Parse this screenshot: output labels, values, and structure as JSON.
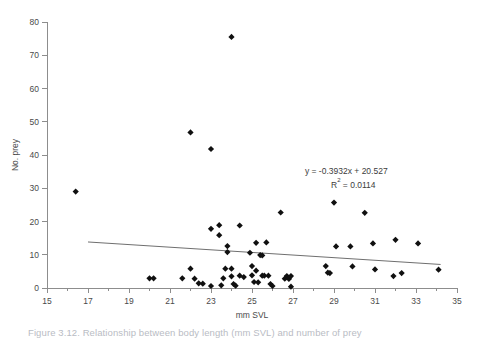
{
  "figure": {
    "caption": "Figure 3.12. Relationship between body length (mm SVL) and number of prey"
  },
  "annotation": {
    "equation": "y = -0.3932x + 20.527",
    "r_squared_prefix": "R",
    "r_squared_exponent": "2",
    "r_squared_value": " = 0.0114"
  },
  "colors": {
    "marker": "#101010",
    "trendline": "#6f6f6f",
    "axis": "#8d8d8d",
    "text": "#4a4a4a",
    "background": "#ffffff"
  },
  "chart_data": {
    "type": "scatter",
    "title": "",
    "xlabel": "mm SVL",
    "ylabel": "No. prey",
    "xlim": [
      15,
      35
    ],
    "ylim": [
      0,
      80
    ],
    "xticks": [
      15,
      17,
      19,
      21,
      23,
      25,
      27,
      29,
      31,
      33,
      35
    ],
    "xticks_minor": [
      16,
      18,
      20,
      22,
      24,
      26,
      28,
      30,
      32,
      34
    ],
    "yticks": [
      0,
      10,
      20,
      30,
      40,
      50,
      60,
      70,
      80
    ],
    "grid": false,
    "legend": false,
    "marker_shape": "diamond",
    "series": [
      {
        "name": "No. prey",
        "points": [
          [
            16.4,
            29.0
          ],
          [
            20.0,
            2.9
          ],
          [
            20.2,
            2.9
          ],
          [
            21.6,
            2.9
          ],
          [
            22.0,
            46.8
          ],
          [
            22.0,
            5.8
          ],
          [
            22.2,
            2.8
          ],
          [
            22.4,
            1.4
          ],
          [
            22.6,
            1.3
          ],
          [
            23.0,
            41.8
          ],
          [
            23.0,
            17.8
          ],
          [
            23.0,
            0.6
          ],
          [
            23.4,
            18.9
          ],
          [
            23.4,
            15.9
          ],
          [
            23.5,
            0.8
          ],
          [
            23.6,
            2.9
          ],
          [
            23.7,
            5.8
          ],
          [
            23.8,
            12.6
          ],
          [
            23.8,
            10.8
          ],
          [
            24.0,
            75.5
          ],
          [
            24.0,
            5.8
          ],
          [
            24.0,
            3.5
          ],
          [
            24.1,
            1.2
          ],
          [
            24.2,
            0.7
          ],
          [
            24.4,
            18.8
          ],
          [
            24.4,
            3.7
          ],
          [
            24.6,
            3.3
          ],
          [
            24.9,
            10.6
          ],
          [
            25.0,
            6.6
          ],
          [
            25.0,
            3.8
          ],
          [
            25.1,
            1.8
          ],
          [
            25.2,
            13.6
          ],
          [
            25.2,
            5.2
          ],
          [
            25.3,
            1.7
          ],
          [
            25.4,
            9.9
          ],
          [
            25.5,
            9.8
          ],
          [
            25.5,
            3.7
          ],
          [
            25.6,
            3.7
          ],
          [
            25.7,
            13.7
          ],
          [
            25.8,
            3.7
          ],
          [
            25.9,
            1.2
          ],
          [
            26.0,
            0.6
          ],
          [
            26.4,
            22.7
          ],
          [
            26.6,
            2.8
          ],
          [
            26.7,
            3.6
          ],
          [
            26.8,
            2.7
          ],
          [
            26.9,
            3.6
          ],
          [
            26.9,
            0.4
          ],
          [
            28.6,
            6.6
          ],
          [
            28.7,
            4.6
          ],
          [
            28.8,
            4.5
          ],
          [
            29.0,
            25.7
          ],
          [
            29.1,
            12.5
          ],
          [
            29.8,
            12.5
          ],
          [
            29.9,
            6.5
          ],
          [
            30.5,
            22.6
          ],
          [
            30.9,
            13.4
          ],
          [
            31.0,
            5.6
          ],
          [
            31.9,
            3.6
          ],
          [
            32.0,
            14.5
          ],
          [
            32.3,
            4.5
          ],
          [
            33.1,
            13.4
          ],
          [
            34.1,
            5.5
          ]
        ]
      }
    ],
    "trendline": {
      "slope": -0.3932,
      "intercept": 20.527,
      "x_start": 17.0,
      "x_end": 34.2,
      "equation": "y = -0.3932x + 20.527",
      "r_squared": 0.0114
    }
  }
}
